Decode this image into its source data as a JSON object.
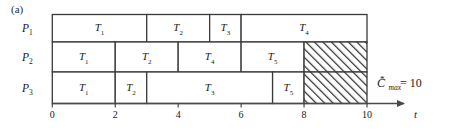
{
  "figure": {
    "panel_label": "(a)",
    "axis_x_name": "t",
    "cmax": {
      "symbol": "C",
      "sub": "max",
      "star": "*",
      "equals": "= 10"
    }
  },
  "axis": {
    "ticks": [
      {
        "value": 0,
        "label": "0"
      },
      {
        "value": 2,
        "label": "2"
      },
      {
        "value": 4,
        "label": "4"
      },
      {
        "value": 6,
        "label": "6"
      },
      {
        "value": 8,
        "label": "8"
      },
      {
        "value": 10,
        "label": "10"
      }
    ],
    "x_min": 0,
    "x_max": 10
  },
  "rows": [
    {
      "label_main": "P",
      "label_sub": "1",
      "name": "P1",
      "blocks": [
        {
          "task": "T",
          "sub": "1",
          "start": 0,
          "end": 3,
          "hatched": false
        },
        {
          "task": "T",
          "sub": "2",
          "start": 3,
          "end": 5,
          "hatched": false
        },
        {
          "task": "T",
          "sub": "3",
          "start": 5,
          "end": 6,
          "hatched": false
        },
        {
          "task": "T",
          "sub": "4",
          "start": 6,
          "end": 10,
          "hatched": false
        }
      ]
    },
    {
      "label_main": "P",
      "label_sub": "2",
      "name": "P2",
      "blocks": [
        {
          "task": "T",
          "sub": "1",
          "start": 0,
          "end": 2,
          "hatched": false
        },
        {
          "task": "T",
          "sub": "2",
          "start": 2,
          "end": 4,
          "hatched": false
        },
        {
          "task": "T",
          "sub": "4",
          "start": 4,
          "end": 6,
          "hatched": false
        },
        {
          "task": "T",
          "sub": "5",
          "start": 6,
          "end": 8,
          "hatched": false
        },
        {
          "task": "",
          "sub": "",
          "start": 8,
          "end": 10,
          "hatched": true
        }
      ]
    },
    {
      "label_main": "P",
      "label_sub": "3",
      "name": "P3",
      "blocks": [
        {
          "task": "T",
          "sub": "1",
          "start": 0,
          "end": 2,
          "hatched": false
        },
        {
          "task": "T",
          "sub": "2",
          "start": 2,
          "end": 3,
          "hatched": false
        },
        {
          "task": "T",
          "sub": "3",
          "start": 3,
          "end": 7,
          "hatched": false
        },
        {
          "task": "T",
          "sub": "5",
          "start": 7,
          "end": 8,
          "hatched": false
        },
        {
          "task": "",
          "sub": "",
          "start": 8,
          "end": 10,
          "hatched": true
        }
      ]
    }
  ],
  "chart_data": {
    "type": "bar",
    "title": "(a)",
    "xlabel": "t",
    "ylabel": "",
    "xlim": [
      0,
      10
    ],
    "categories": [
      "P1",
      "P2",
      "P3"
    ],
    "series": [
      {
        "name": "P1",
        "intervals": [
          [
            0,
            3,
            "T1"
          ],
          [
            3,
            5,
            "T2"
          ],
          [
            5,
            6,
            "T3"
          ],
          [
            6,
            10,
            "T4"
          ]
        ]
      },
      {
        "name": "P2",
        "intervals": [
          [
            0,
            2,
            "T1"
          ],
          [
            2,
            4,
            "T2"
          ],
          [
            4,
            6,
            "T4"
          ],
          [
            6,
            8,
            "T5"
          ],
          [
            8,
            10,
            "idle"
          ]
        ]
      },
      {
        "name": "P3",
        "intervals": [
          [
            0,
            2,
            "T1"
          ],
          [
            2,
            3,
            "T2"
          ],
          [
            3,
            7,
            "T3"
          ],
          [
            7,
            8,
            "T5"
          ],
          [
            8,
            10,
            "idle"
          ]
        ]
      }
    ],
    "annotations": [
      "C*max = 10"
    ],
    "grid": false,
    "legend": "none"
  },
  "colors": {
    "line": "#3a3a3a",
    "text": "#1a1a1a",
    "hatch": "#2b2b2b",
    "background": "#ffffff"
  }
}
